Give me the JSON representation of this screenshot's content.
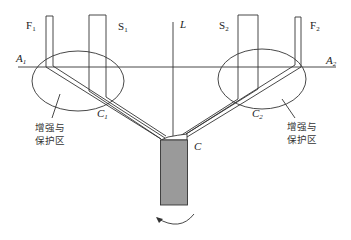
{
  "diagram": {
    "labels": {
      "F1": {
        "base": "F",
        "sub": "1"
      },
      "S1": {
        "base": "S",
        "sub": "1"
      },
      "L": {
        "base": "L",
        "sub": ""
      },
      "S2": {
        "base": "S",
        "sub": "2"
      },
      "F2": {
        "base": "F",
        "sub": "2"
      },
      "A1": {
        "base": "A",
        "sub": "1"
      },
      "A2": {
        "base": "A",
        "sub": "2"
      },
      "C1": {
        "base": "C",
        "sub": "1"
      },
      "C2": {
        "base": "C",
        "sub": "2"
      },
      "C": {
        "base": "C",
        "sub": ""
      }
    },
    "zone_left": {
      "line1": "增强与",
      "line2": "保护区"
    },
    "zone_right": {
      "line1": "增强与",
      "line2": "保护区"
    },
    "colors": {
      "stroke": "#333333",
      "block_fill": "#9a9a9a",
      "background": "#ffffff"
    }
  }
}
